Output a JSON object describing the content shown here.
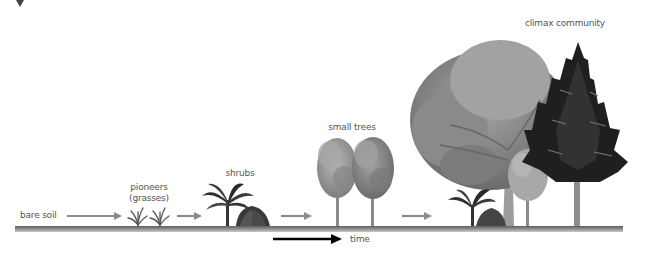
{
  "diagram": {
    "stages": [
      {
        "label": "bare soil",
        "x": 20,
        "y": 210
      },
      {
        "label": "pioneers",
        "sublabel": "(grasses)",
        "x": 149,
        "y": 183
      },
      {
        "label": "shrubs",
        "x": 240,
        "y": 169
      },
      {
        "label": "small trees",
        "x": 352,
        "y": 123
      },
      {
        "label": "climax community",
        "x": 565,
        "y": 19
      }
    ],
    "time_axis": {
      "label": "time"
    },
    "colors": {
      "ground": "#7a7a7a",
      "stage_arrow": "#8c8c8c",
      "time_arrow": "#000000",
      "label_text": "#555555",
      "foliage_light": "#9a9a9a",
      "foliage_mid": "#6e6e6e",
      "foliage_dark": "#2d2d2d"
    }
  }
}
